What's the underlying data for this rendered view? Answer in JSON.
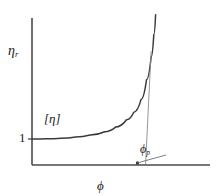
{
  "chart_data": {
    "type": "line",
    "title": "",
    "subtitle": "",
    "xlabel": "ϕ",
    "ylabel": "η",
    "ylabel_sub": "r",
    "xlabel_plain": "phi",
    "ylabel_plain": "eta_r",
    "grid": false,
    "legend": "none",
    "xlim": [
      0,
      1
    ],
    "ylim": [
      0,
      1
    ],
    "y_ticks": [
      "1"
    ],
    "y_tick_values": [
      1
    ],
    "x_ticks": [],
    "annotations": [
      {
        "name": "intrinsic-viscosity",
        "text": "[η]",
        "meaning": "intrinsic viscosity, initial slope of curve",
        "x": 0.12,
        "y": 0.42
      },
      {
        "name": "packing-fraction",
        "text": "ϕ",
        "sub": "p",
        "meaning": "maximum packing fraction, vertical asymptote",
        "x": 0.62,
        "y": 0.06
      }
    ],
    "series": [
      {
        "name": "relative viscosity curve",
        "description": "Flat at y = 1 for small phi, then diverges steeply toward vertical asymptote at phi_p",
        "x": [
          0.0,
          0.08,
          0.16,
          0.24,
          0.32,
          0.4,
          0.46,
          0.52,
          0.56,
          0.6,
          0.63,
          0.655,
          0.67,
          0.68
        ],
        "y": [
          1.0,
          1.01,
          1.03,
          1.07,
          1.14,
          1.26,
          1.42,
          1.68,
          1.95,
          2.4,
          3.1,
          3.9,
          4.7,
          5.4
        ]
      },
      {
        "name": "asymptote",
        "description": "Thin vertical asymptote line at phi_p",
        "x": [
          0.655,
          0.625
        ],
        "y": [
          4.1,
          0.0
        ]
      }
    ],
    "phi_p": 0.64,
    "baseline_value": 1
  },
  "labels": {
    "y_axis": "η",
    "y_axis_sub": "r",
    "x_axis": "ϕ",
    "y_tick_one": "1",
    "intrinsic_viscosity": "[η]",
    "phi_p": "ϕ",
    "phi_p_sub": "p"
  },
  "colors": {
    "background": "#ffffff",
    "axis": "#4a4a4a",
    "curve": "#3a3a3a",
    "asymptote": "#7a7a7a",
    "text": "#222222",
    "leader": "#6e6e6e"
  }
}
